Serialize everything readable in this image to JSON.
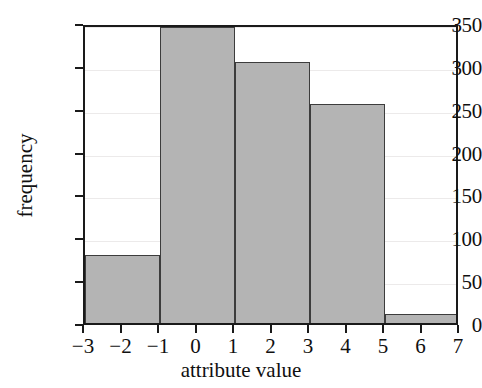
{
  "chart_data": {
    "type": "bar",
    "title": "",
    "subtitle": "",
    "xlabel": "attribute value",
    "ylabel": "frequency",
    "xlim": [
      -3,
      7
    ],
    "ylim": [
      0,
      350
    ],
    "grid": true,
    "legend": false,
    "legend_position": "none",
    "bar_fill_color": "#b4b4b4",
    "bar_edge_color": "#3c3c3c",
    "axis_color": "#1a1a1a",
    "grid_color": "#eceaea",
    "background_color": "#ffffff",
    "xtick_labels": [
      "−3",
      "−2",
      "−1",
      "0",
      "1",
      "2",
      "3",
      "4",
      "5",
      "6",
      "7"
    ],
    "xtick_values": [
      -3,
      -2,
      -1,
      0,
      1,
      2,
      3,
      4,
      5,
      6,
      7
    ],
    "ytick_labels": [
      "0",
      "50",
      "100",
      "150",
      "200",
      "250",
      "300",
      "350"
    ],
    "ytick_values": [
      0,
      50,
      100,
      150,
      200,
      250,
      300,
      350
    ],
    "bin_edges": [
      -3,
      -1,
      1,
      3,
      5,
      7
    ],
    "bin_labels": [
      "[-3, -1)",
      "[-1, 1)",
      "[1, 3)",
      "[3, 5)",
      "[5, 7)"
    ],
    "values": [
      79,
      345,
      304,
      256,
      10
    ],
    "bars": [
      {
        "left": -3,
        "right": -1,
        "value": 79
      },
      {
        "left": -1,
        "right": 1,
        "value": 345
      },
      {
        "left": 1,
        "right": 3,
        "value": 304
      },
      {
        "left": 3,
        "right": 5,
        "value": 256
      },
      {
        "left": 5,
        "right": 7,
        "value": 10
      }
    ]
  }
}
